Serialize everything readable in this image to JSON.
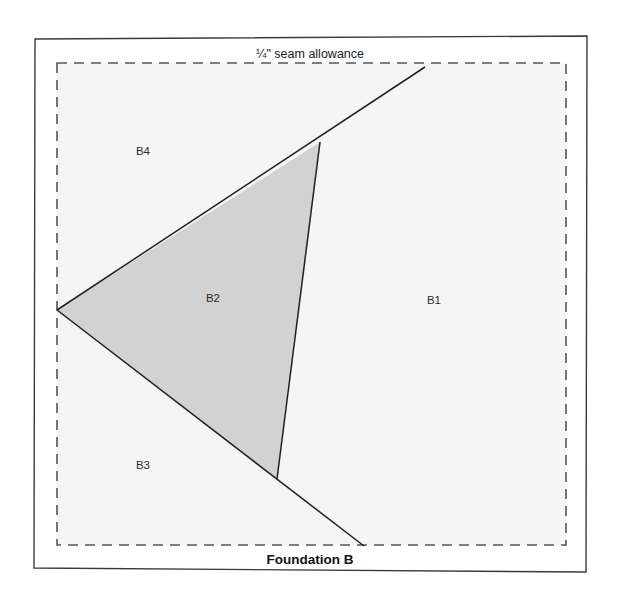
{
  "diagram": {
    "title": "Foundation B",
    "seam_allowance_note": "¼\" seam allowance",
    "colors": {
      "page_background": "#ffffff",
      "panel_background": "#ffffff",
      "sewing_area_background": "#f5f5f5",
      "shaded_piece_fill": "#d2d2d2",
      "outline_stroke": "#3a3a3a",
      "piece_line_stroke": "#1f1f1f",
      "dashed_stroke": "#555555",
      "label_text": "#2b2b2b"
    },
    "outer_border": {
      "x": 34,
      "y": 36,
      "width": 553,
      "height": 536
    },
    "seam_allowance_rect": {
      "x": 57,
      "y": 63,
      "width": 509,
      "height": 482,
      "dash": "10 7"
    },
    "pieces": [
      {
        "id": "B1",
        "label": "B1",
        "label_x": 434,
        "label_y": 301,
        "shaded": false
      },
      {
        "id": "B2",
        "label": "B2",
        "label_x": 213,
        "label_y": 299,
        "shaded": true
      },
      {
        "id": "B3",
        "label": "B3",
        "label_x": 143,
        "label_y": 466,
        "shaded": false
      },
      {
        "id": "B4",
        "label": "B4",
        "label_x": 143,
        "label_y": 152,
        "shaded": false
      }
    ],
    "shaded_piece_polygon": "57,310 320,142 277,479",
    "seam_lines": [
      {
        "name": "b4-b2-b1-diagonal",
        "x1": 57,
        "y1": 310,
        "x2": 425,
        "y2": 67
      },
      {
        "name": "b2-b1-right-edge",
        "x1": 320,
        "y1": 142,
        "x2": 277,
        "y2": 479
      },
      {
        "name": "b3-b2-b1-diagonal",
        "x1": 57,
        "y1": 310,
        "x2": 364,
        "y2": 546
      }
    ],
    "note_position": {
      "x": 310,
      "y": 55
    },
    "title_position": {
      "x": 310,
      "y": 560
    }
  }
}
